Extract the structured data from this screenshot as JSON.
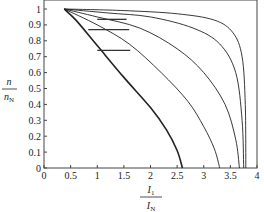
{
  "chart_data": {
    "type": "line",
    "title": "",
    "xlabel": "I1 / IN",
    "ylabel": "n / nN",
    "xlim": [
      0,
      4
    ],
    "ylim": [
      0,
      1.05
    ],
    "x_ticks": [
      "0",
      "0.5",
      "1",
      "1.5",
      "2",
      "2.5",
      "3",
      "3.5",
      "4"
    ],
    "y_ticks": [
      "0",
      "0.1",
      "0.2",
      "0.3",
      "0.4",
      "0.5",
      "0.6",
      "0.7",
      "0.8",
      "0.9",
      "1"
    ],
    "grid": false,
    "legend": null,
    "series": [
      {
        "name": "curve-1 (bold)",
        "points": [
          [
            0.38,
            1.0
          ],
          [
            0.6,
            0.93
          ],
          [
            1.0,
            0.77
          ],
          [
            1.5,
            0.57
          ],
          [
            2.0,
            0.38
          ],
          [
            2.3,
            0.24
          ],
          [
            2.5,
            0.11
          ],
          [
            2.6,
            0.0
          ]
        ]
      },
      {
        "name": "curve-2",
        "points": [
          [
            0.38,
            1.0
          ],
          [
            1.0,
            0.9
          ],
          [
            1.6,
            0.78
          ],
          [
            2.2,
            0.6
          ],
          [
            2.7,
            0.42
          ],
          [
            3.0,
            0.26
          ],
          [
            3.2,
            0.12
          ],
          [
            3.3,
            0.0
          ]
        ]
      },
      {
        "name": "curve-3",
        "points": [
          [
            0.38,
            1.0
          ],
          [
            1.0,
            0.95
          ],
          [
            1.8,
            0.88
          ],
          [
            2.5,
            0.75
          ],
          [
            3.0,
            0.6
          ],
          [
            3.4,
            0.4
          ],
          [
            3.6,
            0.18
          ],
          [
            3.67,
            0.0
          ]
        ]
      },
      {
        "name": "curve-4",
        "points": [
          [
            0.38,
            1.0
          ],
          [
            1.2,
            0.975
          ],
          [
            2.0,
            0.95
          ],
          [
            2.8,
            0.88
          ],
          [
            3.3,
            0.78
          ],
          [
            3.6,
            0.6
          ],
          [
            3.72,
            0.3
          ],
          [
            3.75,
            0.0
          ]
        ]
      },
      {
        "name": "curve-5",
        "points": [
          [
            0.38,
            1.0
          ],
          [
            1.5,
            0.99
          ],
          [
            2.5,
            0.97
          ],
          [
            3.2,
            0.93
          ],
          [
            3.55,
            0.85
          ],
          [
            3.72,
            0.7
          ],
          [
            3.78,
            0.4
          ],
          [
            3.79,
            0.0
          ]
        ]
      }
    ],
    "horizontal_segments": [
      {
        "y": 0.74,
        "x_from": 1.0,
        "x_to": 1.62
      },
      {
        "y": 0.87,
        "x_from": 0.83,
        "x_to": 1.6
      },
      {
        "y": 0.935,
        "x_from": 1.0,
        "x_to": 1.55
      }
    ]
  },
  "labels": {
    "x_main": "I",
    "x_num_sub": "1",
    "x_den_sub": "N",
    "y_main": "n",
    "y_den_sub": "N"
  }
}
